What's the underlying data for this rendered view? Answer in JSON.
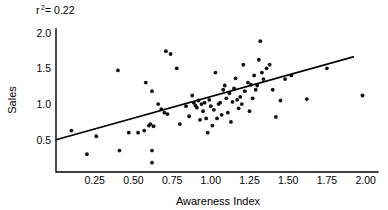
{
  "chart_data": {
    "type": "scatter",
    "title": "",
    "subtitle": "",
    "xlabel": "Awareness Index",
    "ylabel": "Sales",
    "xlim": [
      0.0,
      2.08
    ],
    "ylim": [
      0.05,
      2.05
    ],
    "grid": false,
    "legend": null,
    "xticks": [
      0.25,
      0.5,
      0.75,
      1.0,
      1.25,
      1.5,
      1.75,
      2.0
    ],
    "xtick_labels": [
      "0.25",
      "0.50",
      "0.75",
      "1.00",
      "1.25",
      "1.50",
      "1.75",
      "2.00"
    ],
    "yticks": [
      0.5,
      1.0,
      1.5,
      2.0
    ],
    "ytick_labels": [
      "0.5",
      "1.0",
      "1.5",
      "2.0"
    ],
    "annotations": [
      {
        "name": "r-squared",
        "base": "r",
        "superscript": "2",
        "equals": "= 0.22",
        "full_text": "r2= 0.22",
        "x": 0.13,
        "y": 2.0
      }
    ],
    "trendline": {
      "type": "linear-fit",
      "x_start": 0.0,
      "y_start": 0.5,
      "x_end": 1.92,
      "y_end": 1.66,
      "slope": 0.604,
      "intercept": 0.5
    },
    "r_squared": 0.22,
    "n_points": 81,
    "points": [
      [
        0.1,
        0.63
      ],
      [
        0.2,
        0.3
      ],
      [
        0.26,
        0.55
      ],
      [
        0.4,
        1.47
      ],
      [
        0.41,
        0.35
      ],
      [
        0.47,
        0.6
      ],
      [
        0.53,
        0.6
      ],
      [
        0.57,
        0.63
      ],
      [
        0.58,
        1.3
      ],
      [
        0.6,
        0.7
      ],
      [
        0.61,
        0.72
      ],
      [
        0.62,
        1.18
      ],
      [
        0.62,
        0.35
      ],
      [
        0.62,
        0.18
      ],
      [
        0.63,
        0.69
      ],
      [
        0.66,
        1.0
      ],
      [
        0.68,
        0.93
      ],
      [
        0.7,
        0.88
      ],
      [
        0.71,
        1.74
      ],
      [
        0.72,
        0.86
      ],
      [
        0.74,
        1.7
      ],
      [
        0.78,
        1.5
      ],
      [
        0.8,
        0.72
      ],
      [
        0.84,
        0.97
      ],
      [
        0.86,
        0.83
      ],
      [
        0.88,
        1.12
      ],
      [
        0.89,
        1.02
      ],
      [
        0.9,
        0.98
      ],
      [
        0.91,
        0.95
      ],
      [
        0.92,
        1.05
      ],
      [
        0.93,
        0.78
      ],
      [
        0.94,
        1.0
      ],
      [
        0.95,
        0.9
      ],
      [
        0.96,
        1.02
      ],
      [
        0.97,
        0.8
      ],
      [
        0.98,
        0.6
      ],
      [
        0.99,
        1.06
      ],
      [
        1.0,
        0.97
      ],
      [
        1.01,
        0.7
      ],
      [
        1.02,
        0.92
      ],
      [
        1.03,
        1.44
      ],
      [
        1.04,
        0.8
      ],
      [
        1.05,
        1.0
      ],
      [
        1.06,
        1.02
      ],
      [
        1.07,
        0.85
      ],
      [
        1.08,
        1.2
      ],
      [
        1.09,
        1.26
      ],
      [
        1.1,
        1.08
      ],
      [
        1.11,
        0.88
      ],
      [
        1.12,
        1.15
      ],
      [
        1.13,
        0.75
      ],
      [
        1.14,
        1.03
      ],
      [
        1.15,
        1.22
      ],
      [
        1.16,
        1.36
      ],
      [
        1.17,
        1.06
      ],
      [
        1.18,
        0.94
      ],
      [
        1.19,
        1.1
      ],
      [
        1.2,
        1.0
      ],
      [
        1.21,
        1.55
      ],
      [
        1.22,
        1.18
      ],
      [
        1.24,
        1.3
      ],
      [
        1.25,
        0.9
      ],
      [
        1.26,
        1.27
      ],
      [
        1.27,
        1.08
      ],
      [
        1.28,
        1.4
      ],
      [
        1.29,
        1.2
      ],
      [
        1.3,
        1.26
      ],
      [
        1.31,
        1.62
      ],
      [
        1.32,
        1.88
      ],
      [
        1.33,
        1.44
      ],
      [
        1.34,
        1.35
      ],
      [
        1.36,
        1.5
      ],
      [
        1.38,
        1.55
      ],
      [
        1.4,
        1.2
      ],
      [
        1.42,
        0.82
      ],
      [
        1.45,
        1.05
      ],
      [
        1.48,
        1.35
      ],
      [
        1.52,
        1.4
      ],
      [
        1.62,
        1.07
      ],
      [
        1.75,
        1.5
      ],
      [
        1.98,
        1.12
      ]
    ]
  }
}
